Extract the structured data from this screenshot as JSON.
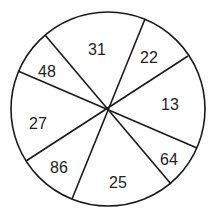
{
  "diagram": {
    "type": "segmented-circle",
    "center": [
      108,
      109
    ],
    "radius": 97,
    "stroke_color": "#1a1a1a",
    "divider_lines": [
      {
        "from": [
          45,
          35
        ],
        "to": [
          171,
          184
        ]
      },
      {
        "from": [
          18,
          71
        ],
        "to": [
          197,
          148
        ]
      },
      {
        "from": [
          145,
          19
        ],
        "to": [
          72,
          199
        ]
      },
      {
        "from": [
          188,
          56
        ],
        "to": [
          26,
          161
        ]
      }
    ],
    "segments": [
      {
        "label": "31",
        "x": 97,
        "y": 51
      },
      {
        "label": "22",
        "x": 149,
        "y": 59
      },
      {
        "label": "13",
        "x": 170,
        "y": 106
      },
      {
        "label": "64",
        "x": 169,
        "y": 161
      },
      {
        "label": "25",
        "x": 118,
        "y": 184
      },
      {
        "label": "86",
        "x": 59,
        "y": 169
      },
      {
        "label": "27",
        "x": 38,
        "y": 125
      },
      {
        "label": "48",
        "x": 47,
        "y": 73
      }
    ]
  }
}
